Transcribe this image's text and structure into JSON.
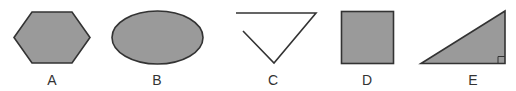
{
  "figure": {
    "shapes": [
      {
        "id": "A",
        "label": "A",
        "type": "hexagon",
        "filled": true,
        "closed": true
      },
      {
        "id": "B",
        "label": "B",
        "type": "ellipse",
        "filled": true,
        "closed": true
      },
      {
        "id": "C",
        "label": "C",
        "type": "open-triangle",
        "filled": false,
        "closed": false
      },
      {
        "id": "D",
        "label": "D",
        "type": "square",
        "filled": true,
        "closed": true
      },
      {
        "id": "E",
        "label": "E",
        "type": "right-triangle",
        "filled": true,
        "closed": true,
        "right_angle_marker": true
      }
    ],
    "colors": {
      "fill": "#9a9a9a",
      "stroke": "#333333",
      "background": "#ffffff"
    }
  }
}
